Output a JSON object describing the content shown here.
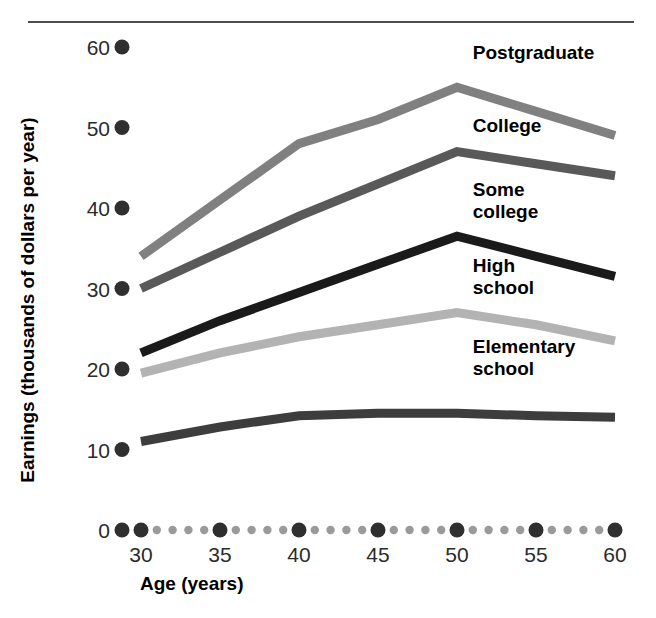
{
  "chart_data": {
    "type": "line",
    "title": "",
    "xlabel": "Age (years)",
    "ylabel": "Earnings (thousands of dollars per year)",
    "xlim": [
      27.5,
      61.5
    ],
    "ylim": [
      0,
      62
    ],
    "xticks": [
      30,
      35,
      40,
      45,
      50,
      55,
      60
    ],
    "xticklabels": [
      "30",
      "35",
      "40",
      "45",
      "50",
      "55",
      "60"
    ],
    "yticks": [
      0,
      10,
      20,
      30,
      40,
      50,
      60
    ],
    "yticklabels": [
      "0",
      "10",
      "20",
      "30",
      "40",
      "50",
      "60"
    ],
    "grid": false,
    "legend_position": "inline-right-of-lines",
    "tick_marker_style": "dot",
    "x": [
      30,
      35,
      40,
      45,
      50,
      55,
      60
    ],
    "series": [
      {
        "name": "Postgraduate",
        "label": "Postgraduate",
        "color": "#808080",
        "values": [
          34,
          41,
          48,
          51,
          55,
          52,
          49
        ],
        "label_x": 51,
        "label_y": 58.5
      },
      {
        "name": "College",
        "label": "College",
        "color": "#595959",
        "values": [
          30,
          34.5,
          39,
          43,
          47,
          45.5,
          44
        ],
        "label_x": 51,
        "label_y": 49.5
      },
      {
        "name": "Some college",
        "label": "Some college",
        "color": "#1a1a1a",
        "values": [
          22,
          26,
          29.5,
          33,
          36.5,
          34,
          31.5
        ],
        "label_x": 51,
        "label_y": 41.5,
        "label_lines": [
          "Some",
          "college"
        ]
      },
      {
        "name": "High school",
        "label": "High school",
        "color": "#b3b3b3",
        "values": [
          19.5,
          22,
          24,
          25.5,
          27,
          25.5,
          23.5
        ],
        "label_x": 51,
        "label_y": 32,
        "label_lines": [
          "High",
          "school"
        ]
      },
      {
        "name": "Elementary school",
        "label": "Elementary school",
        "color": "#3d3d3d",
        "values": [
          11,
          12.8,
          14.2,
          14.5,
          14.5,
          14.2,
          14
        ],
        "label_x": 51,
        "label_y": 22,
        "label_lines": [
          "Elementary",
          "school"
        ]
      }
    ]
  },
  "axes": {
    "x_title": "Age (years)",
    "y_title": "Earnings (thousands of dollars per year)"
  },
  "ticks": {
    "y": [
      "60",
      "50",
      "40",
      "30",
      "20",
      "10",
      "0"
    ],
    "x": [
      "30",
      "35",
      "40",
      "45",
      "50",
      "55",
      "60"
    ]
  },
  "labels": {
    "postgraduate": "Postgraduate",
    "college": "College",
    "some_college_l1": "Some",
    "some_college_l2": "college",
    "high_school_l1": "High",
    "high_school_l2": "school",
    "elementary_l1": "Elementary",
    "elementary_l2": "school"
  },
  "colors": {
    "postgraduate": "#808080",
    "college": "#595959",
    "some_college": "#1a1a1a",
    "high_school": "#b3b3b3",
    "elementary": "#3d3d3d",
    "tick_dot_major": "#2f2f2f",
    "tick_dot_minor": "#9a9a9a",
    "rule": "#4d4d4d",
    "text": "#000000"
  }
}
